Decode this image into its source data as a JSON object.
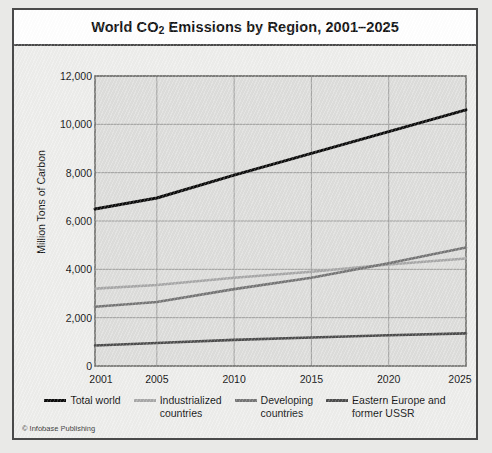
{
  "figure": {
    "title_prefix": "World CO",
    "title_sub": "2",
    "title_suffix": " Emissions by Region, 2001–2025",
    "title_full": "World CO2 Emissions by Region, 2001–2025",
    "credit": "© Infobase Publishing"
  },
  "chart_data": {
    "type": "line",
    "title": "World CO2 Emissions by Region, 2001–2025",
    "xlabel": "",
    "ylabel": "Million Tons of Carbon",
    "xlim": [
      2001,
      2025
    ],
    "ylim": [
      0,
      12000
    ],
    "xticks": [
      2001,
      2005,
      2010,
      2015,
      2020,
      2025
    ],
    "xtick_labels": [
      "2001",
      "2005",
      "2010",
      "2015",
      "2020",
      "2025"
    ],
    "yticks": [
      0,
      2000,
      4000,
      6000,
      8000,
      10000,
      12000
    ],
    "ytick_labels": [
      "0",
      "2,000",
      "4,000",
      "6,000",
      "8,000",
      "10,000",
      "12,000"
    ],
    "grid": true,
    "legend_position": "below",
    "x": [
      2001,
      2005,
      2010,
      2015,
      2020,
      2025
    ],
    "series": [
      {
        "name": "Total world",
        "color": "#0d0d0d",
        "width": 3.0,
        "values": [
          6500,
          6950,
          7900,
          8800,
          9700,
          10600
        ]
      },
      {
        "name": "Industrialized countries",
        "color": "#a8a8a8",
        "width": 2.6,
        "values": [
          3200,
          3350,
          3650,
          3900,
          4200,
          4450
        ]
      },
      {
        "name": "Developing countries",
        "color": "#767676",
        "width": 2.6,
        "values": [
          2450,
          2650,
          3180,
          3650,
          4250,
          4900
        ]
      },
      {
        "name": "Eastern Europe and former USSR",
        "color": "#4d4d4d",
        "width": 2.6,
        "values": [
          850,
          950,
          1080,
          1180,
          1270,
          1350
        ]
      }
    ]
  },
  "legend": {
    "items": [
      {
        "label": "Total world",
        "color": "#0d0d0d"
      },
      {
        "label": "Industrialized\ncountries",
        "color": "#a8a8a8"
      },
      {
        "label": "Developing\ncountries",
        "color": "#767676"
      },
      {
        "label": "Eastern Europe and\nformer USSR",
        "color": "#4d4d4d"
      }
    ]
  }
}
